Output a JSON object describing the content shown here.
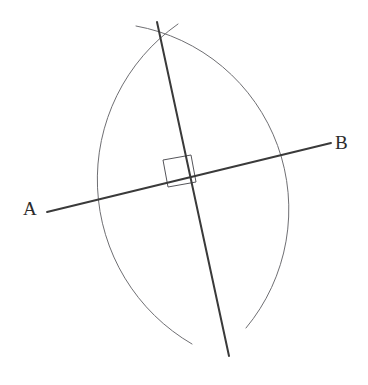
{
  "figure": {
    "kind": "geometric-construction",
    "name": "perpendicular-bisector-construction",
    "background_color": "#ffffff",
    "width": 368,
    "height": 385
  },
  "labels": {
    "a": "A",
    "b": "B"
  },
  "colors": {
    "line_ab": "#3a3a3a",
    "bisector": "#3a3a3a",
    "arc": "#6f6f73",
    "right_angle_mark": "#55555a",
    "label_text": "#2b2b2b"
  },
  "strokes": {
    "line_ab_width": 1.9,
    "bisector_width": 2.0,
    "arc_width": 1.0,
    "right_angle_width": 1.0
  },
  "geometry": {
    "line_ab": {
      "name": "line-ab",
      "x1": 47,
      "y1": 212,
      "x2": 331,
      "y2": 143
    },
    "bisector_line": {
      "name": "perpendicular-bisector",
      "x1": 157,
      "y1": 22,
      "x2": 229,
      "y2": 356
    },
    "arc_left": {
      "name": "arc-left",
      "start_x": 136,
      "start_y": 26,
      "end_x": 246,
      "end_y": 328,
      "radius_x": 186,
      "radius_y": 186,
      "sweep": 1,
      "large_arc": 0
    },
    "arc_right": {
      "name": "arc-right",
      "start_x": 178,
      "start_y": 24,
      "end_x": 192,
      "end_y": 344,
      "radius_x": 190,
      "radius_y": 190,
      "sweep": 0,
      "large_arc": 0
    },
    "intersection_top": {
      "name": "arc-intersection-top",
      "x": 160,
      "y": 38
    },
    "intersection_bottom": {
      "name": "arc-intersection-bottom",
      "x": 218,
      "y": 312
    },
    "midpoint": {
      "name": "midpoint-crossing",
      "x": 189,
      "y": 178
    },
    "right_angle_mark": {
      "name": "right-angle-square",
      "points": "163,160 191,155 196,182 168,187"
    }
  }
}
